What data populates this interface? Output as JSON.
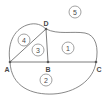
{
  "figure": {
    "stroke_color": "#7a7a7a",
    "label_color": "#4a4a4a",
    "background_color": "#ffffff",
    "vertices": [
      {
        "id": "A",
        "label": "A",
        "x": 10,
        "y": 62,
        "label_x": 7,
        "label_y": 69
      },
      {
        "id": "B",
        "label": "B",
        "x": 48,
        "y": 62,
        "label_x": 48,
        "label_y": 69
      },
      {
        "id": "C",
        "label": "C",
        "x": 96,
        "y": 62,
        "label_x": 99,
        "label_y": 69
      },
      {
        "id": "D",
        "label": "D",
        "x": 46,
        "y": 29,
        "label_x": 46,
        "label_y": 23
      }
    ],
    "regions": [
      {
        "id": "region-1",
        "label": "1",
        "cx": 68,
        "cy": 48,
        "r": 6
      },
      {
        "id": "region-2",
        "label": "2",
        "cx": 46,
        "cy": 80,
        "r": 6
      },
      {
        "id": "region-3",
        "label": "3",
        "cx": 38,
        "cy": 50,
        "r": 6
      },
      {
        "id": "region-4",
        "label": "4",
        "cx": 24,
        "cy": 40,
        "r": 6
      },
      {
        "id": "region-5",
        "label": "5",
        "cx": 75,
        "cy": 12,
        "r": 6
      }
    ],
    "edges": [
      {
        "id": "edge-AC",
        "label": "A to C baseline"
      },
      {
        "id": "edge-AD",
        "label": "A to D chord"
      },
      {
        "id": "edge-DB",
        "label": "D to B segment"
      },
      {
        "id": "arc-AD",
        "label": "arc from A over to D"
      },
      {
        "id": "arc-DC",
        "label": "arc from D around to C"
      },
      {
        "id": "arc-AC",
        "label": "lower arc from A to C"
      }
    ]
  }
}
